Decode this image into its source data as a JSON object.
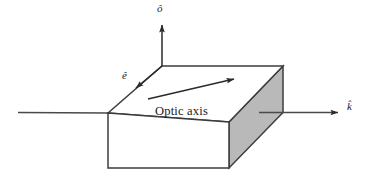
{
  "figure": {
    "canvas": {
      "width": 370,
      "height": 184,
      "background": "#ffffff"
    },
    "colors": {
      "stroke": "#3c3c3c",
      "face_top": "#ffffff",
      "face_front": "#ffffff",
      "face_side": "#b8b8b8",
      "text": "#1a1a1a"
    },
    "labels": {
      "optic_axis": "Optic axis",
      "o_hat": "ô",
      "e_hat": "ê",
      "k_hat": "k̂"
    },
    "geometry": {
      "slab": {
        "top_face": "108,113 162,66 283,66 229,122",
        "front_face": "108,113 229,122 229,168 108,168",
        "side_face": "229,122 283,66 283,112 229,168"
      },
      "axes": [
        {
          "name": "k-axis-incoming",
          "from": [
            18,
            112
          ],
          "to": [
            108,
            113
          ],
          "arrow": false
        },
        {
          "name": "k-axis-outgoing",
          "from": [
            283,
            112
          ],
          "to": [
            341,
            112
          ],
          "arrow": true
        },
        {
          "name": "o-axis",
          "from": [
            162,
            66
          ],
          "to": [
            162,
            22
          ],
          "arrow": true
        },
        {
          "name": "e-axis",
          "from": [
            108,
            113
          ],
          "to": [
            137,
            83
          ],
          "arrow": true
        },
        {
          "name": "optic-axis-arrow",
          "from": [
            148,
            99
          ],
          "to": [
            238,
            78
          ],
          "arrow": true
        }
      ]
    }
  }
}
